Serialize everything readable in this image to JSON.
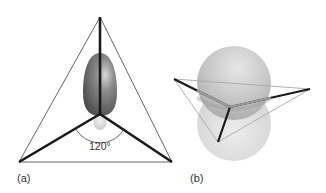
{
  "figure": {
    "panel_a": {
      "label": "(a)",
      "angle_label": "120°",
      "description": "trigonal planar sp2 hybrid with unhybridized p orbital"
    },
    "panel_b": {
      "label": "(b)",
      "description": "perspective view of trigonal plane with p orbital lobes"
    },
    "colors": {
      "bond": "#1a1a1a",
      "outline": "#555555",
      "lobe_dark": "#6e6e6e",
      "lobe_light": "#cfcfcf",
      "sphere": "#bdbdbd"
    }
  }
}
